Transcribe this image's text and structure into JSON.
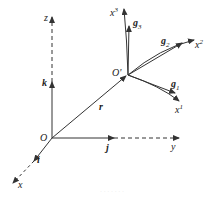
{
  "diagram": {
    "type": "coordinate-frames",
    "colors": {
      "line": "#333333",
      "caption": "#e4e4e4"
    },
    "origin_label": "O",
    "local_origin_label": "O'",
    "position_vector_label": "r",
    "global_axes": {
      "x": {
        "label": "x",
        "unit_vector": "i"
      },
      "y": {
        "label": "y",
        "unit_vector": "j"
      },
      "z": {
        "label": "z",
        "unit_vector": "k"
      }
    },
    "curvilinear_axes": [
      {
        "label": "x",
        "sup": "1",
        "base_vector": "g",
        "sub": "1"
      },
      {
        "label": "x",
        "sup": "2",
        "base_vector": "g",
        "sub": "2"
      },
      {
        "label": "x",
        "sup": "3",
        "base_vector": "g",
        "sub": "3"
      }
    ],
    "caption": "· · · · · · ·"
  }
}
